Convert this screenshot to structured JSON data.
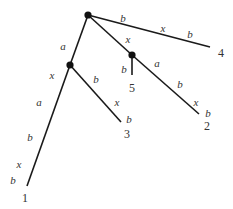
{
  "diagram": {
    "type": "tree",
    "nodes": [
      {
        "id": "root",
        "x": 88,
        "y": 15
      },
      {
        "id": "n_left",
        "x": 70,
        "y": 65
      },
      {
        "id": "n_right",
        "x": 132,
        "y": 55
      }
    ],
    "leaves": [
      {
        "id": "1",
        "label": "1",
        "x": 27,
        "y": 186,
        "label_x": 25,
        "label_y": 202
      },
      {
        "id": "2",
        "label": "2",
        "x": 199,
        "y": 114,
        "label_x": 207,
        "label_y": 130
      },
      {
        "id": "3",
        "label": "3",
        "x": 121,
        "y": 122,
        "label_x": 127,
        "label_y": 138
      },
      {
        "id": "4",
        "label": "4",
        "x": 210,
        "y": 47,
        "label_x": 221,
        "label_y": 57
      },
      {
        "id": "5",
        "label": "5",
        "x": 132,
        "y": 75,
        "label_x": 132,
        "label_y": 92
      }
    ],
    "edges": [
      {
        "from": "root",
        "to": "4",
        "labels": [
          {
            "text": "b",
            "x": 123,
            "y": 22
          },
          {
            "text": "x",
            "x": 163,
            "y": 32
          },
          {
            "text": "b",
            "x": 190,
            "y": 38
          }
        ]
      },
      {
        "from": "root",
        "to": "n_right",
        "labels": [
          {
            "text": "x",
            "x": 128,
            "y": 43
          }
        ]
      },
      {
        "from": "n_right",
        "to": "5",
        "labels": [
          {
            "text": "b",
            "x": 124,
            "y": 73
          }
        ]
      },
      {
        "from": "n_right",
        "to": "2",
        "labels": [
          {
            "text": "a",
            "x": 157,
            "y": 67
          },
          {
            "text": "b",
            "x": 180,
            "y": 88
          },
          {
            "text": "x",
            "x": 196,
            "y": 106
          },
          {
            "text": "b",
            "x": 208,
            "y": 117
          }
        ]
      },
      {
        "from": "root",
        "to": "n_left",
        "labels": [
          {
            "text": "a",
            "x": 63,
            "y": 50
          }
        ]
      },
      {
        "from": "n_left",
        "to": "3",
        "labels": [
          {
            "text": "b",
            "x": 96,
            "y": 83
          },
          {
            "text": "x",
            "x": 117,
            "y": 106
          },
          {
            "text": "b",
            "x": 129,
            "y": 123
          }
        ]
      },
      {
        "from": "n_left",
        "to": "1",
        "labels": [
          {
            "text": "x",
            "x": 52,
            "y": 79
          },
          {
            "text": "a",
            "x": 39,
            "y": 106
          },
          {
            "text": "b",
            "x": 30,
            "y": 141
          },
          {
            "text": "x",
            "x": 19,
            "y": 168
          },
          {
            "text": "b",
            "x": 13,
            "y": 184
          }
        ]
      }
    ]
  }
}
